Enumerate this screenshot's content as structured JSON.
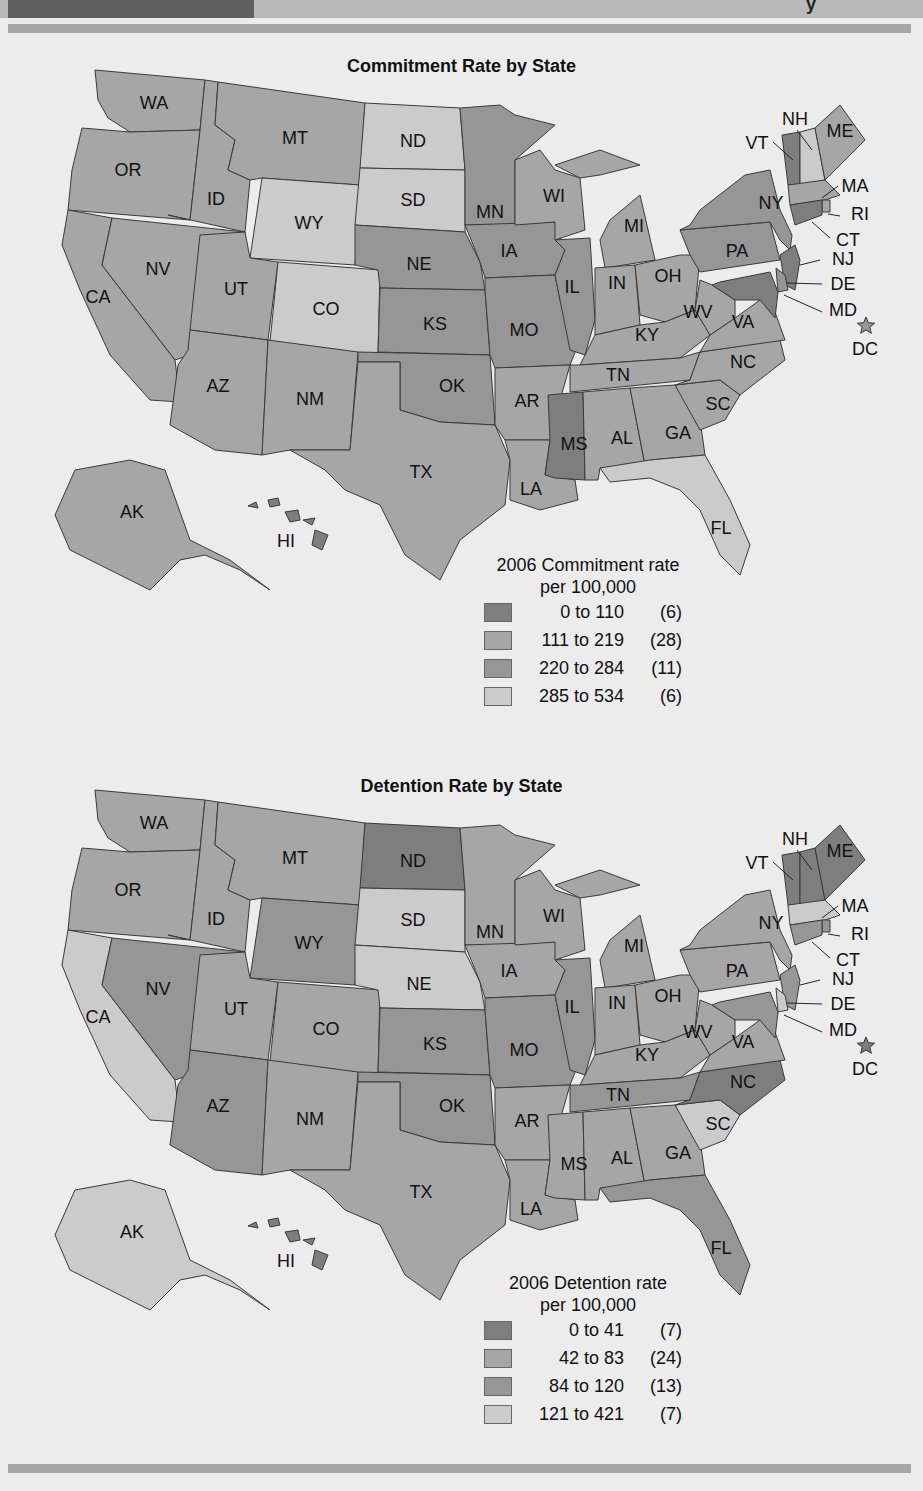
{
  "header": {
    "glyph": "y"
  },
  "colors": {
    "cat1": "#7e7e7e",
    "cat2": "#a6a6a6",
    "cat3": "#969696",
    "cat4": "#cbcbcb",
    "background": "#ececec",
    "rule": "#a7a7a7"
  },
  "commitment": {
    "title": "Commitment Rate by State",
    "legend": {
      "title_line1": "2006 Commitment rate",
      "title_line2": "per 100,000",
      "items": [
        {
          "range": "0 to 110",
          "count": "(6)"
        },
        {
          "range": "111 to 219",
          "count": "(28)"
        },
        {
          "range": "220 to 284",
          "count": "(11)"
        },
        {
          "range": "285 to 534",
          "count": "(6)"
        }
      ]
    }
  },
  "detention": {
    "title": "Detention Rate by State",
    "legend": {
      "title_line1": "2006 Detention rate",
      "title_line2": "per 100,000",
      "items": [
        {
          "range": "0 to 41",
          "count": "(7)"
        },
        {
          "range": "42 to 83",
          "count": "(24)"
        },
        {
          "range": "84 to 120",
          "count": "(13)"
        },
        {
          "range": "121 to 421",
          "count": "(7)"
        }
      ]
    }
  },
  "labels": {
    "WA": "WA",
    "OR": "OR",
    "CA": "CA",
    "ID": "ID",
    "NV": "NV",
    "MT": "MT",
    "WY": "WY",
    "UT": "UT",
    "CO": "CO",
    "AZ": "AZ",
    "NM": "NM",
    "ND": "ND",
    "SD": "SD",
    "NE": "NE",
    "KS": "KS",
    "OK": "OK",
    "TX": "TX",
    "MN": "MN",
    "IA": "IA",
    "MO": "MO",
    "AR": "AR",
    "LA": "LA",
    "WI": "WI",
    "IL": "IL",
    "MI": "MI",
    "IN": "IN",
    "OH": "OH",
    "KY": "KY",
    "TN": "TN",
    "MS": "MS",
    "AL": "AL",
    "GA": "GA",
    "FL": "FL",
    "SC": "SC",
    "NC": "NC",
    "VA": "VA",
    "WV": "WV",
    "PA": "PA",
    "NY": "NY",
    "VT": "VT",
    "NH": "NH",
    "ME": "ME",
    "MA": "MA",
    "RI": "RI",
    "CT": "CT",
    "NJ": "NJ",
    "DE": "DE",
    "MD": "MD",
    "DC": "DC",
    "AK": "AK",
    "HI": "HI"
  },
  "chart_data": [
    {
      "type": "choropleth",
      "title": "Commitment Rate by State",
      "legend_title": "2006 Commitment rate per 100,000",
      "legend_position": "bottom-center-right",
      "classes": [
        {
          "range": "0 to 110",
          "count": 6,
          "shade": "darkest"
        },
        {
          "range": "111 to 219",
          "count": 28,
          "shade": "medium-light"
        },
        {
          "range": "220 to 284",
          "count": 11,
          "shade": "medium"
        },
        {
          "range": "285 to 534",
          "count": 6,
          "shade": "lightest"
        }
      ],
      "states": {
        "0 to 110": [
          "VT",
          "CT",
          "NJ",
          "MD",
          "MS",
          "HI"
        ],
        "285 to 534": [
          "ND",
          "SD",
          "WY",
          "CO",
          "FL",
          "NH"
        ],
        "220 to 284": [
          "NE",
          "KS",
          "OK",
          "MN",
          "IA",
          "IL",
          "MO",
          "PA",
          "DE",
          "NY",
          "DC"
        ],
        "111 to 219": [
          "WA",
          "OR",
          "CA",
          "ID",
          "NV",
          "MT",
          "UT",
          "AZ",
          "NM",
          "TX",
          "AR",
          "LA",
          "WI",
          "MI",
          "IN",
          "OH",
          "KY",
          "TN",
          "AL",
          "GA",
          "SC",
          "NC",
          "VA",
          "WV",
          "ME",
          "MA",
          "RI",
          "AK"
        ]
      }
    },
    {
      "type": "choropleth",
      "title": "Detention Rate by State",
      "legend_title": "2006 Detention rate per 100,000",
      "legend_position": "bottom-center-right",
      "classes": [
        {
          "range": "0 to 41",
          "count": 7,
          "shade": "darkest"
        },
        {
          "range": "42 to 83",
          "count": 24,
          "shade": "medium-light"
        },
        {
          "range": "84 to 120",
          "count": 13,
          "shade": "medium"
        },
        {
          "range": "121 to 421",
          "count": 7,
          "shade": "lightest"
        }
      ],
      "states": {
        "0 to 41": [
          "ND",
          "VT",
          "NH",
          "ME",
          "NC",
          "HI",
          "DC"
        ],
        "121 to 421": [
          "SD",
          "NE",
          "CA",
          "AK",
          "SC",
          "MA",
          "DE"
        ],
        "84 to 120": [
          "NV",
          "AZ",
          "KS",
          "OK",
          "MO",
          "IL",
          "TN",
          "FL",
          "MD",
          "CT",
          "RI",
          "NJ",
          "WY"
        ],
        "42 to 83": [
          "WA",
          "OR",
          "ID",
          "MT",
          "UT",
          "CO",
          "NM",
          "TX",
          "MN",
          "IA",
          "AR",
          "LA",
          "WI",
          "MI",
          "IN",
          "OH",
          "KY",
          "MS",
          "AL",
          "GA",
          "VA",
          "WV",
          "PA",
          "NY"
        ]
      }
    }
  ]
}
